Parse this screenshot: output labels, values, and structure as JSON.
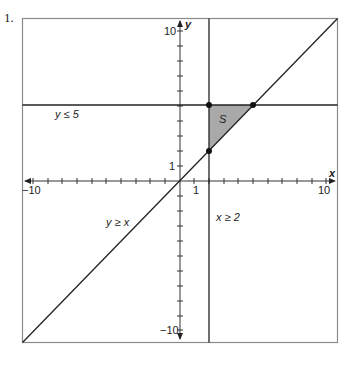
{
  "problem_number": "1.",
  "graph": {
    "x_axis_label": "x",
    "y_axis_label": "y",
    "x_range": [
      -11,
      11
    ],
    "y_range": [
      -11,
      11
    ],
    "tick_labels": {
      "x_neg": "−10",
      "x_pos": "10",
      "x_one": "1",
      "y_pos": "10",
      "y_neg": "−10",
      "y_one": "1"
    },
    "lines": [
      {
        "name": "y-le-5",
        "label": "y ≤ 5",
        "equation": "y = 5"
      },
      {
        "name": "y-ge-x",
        "label": "y ≥ x",
        "equation": "y = x"
      },
      {
        "name": "x-ge-2",
        "label": "x ≥ 2",
        "equation": "x = 2"
      }
    ],
    "region": {
      "label": "S",
      "vertices": [
        [
          2,
          5
        ],
        [
          5,
          5
        ],
        [
          2,
          2
        ]
      ],
      "fill": "#a9a9a9"
    },
    "points": [
      [
        2,
        5
      ],
      [
        5,
        5
      ],
      [
        2,
        2
      ]
    ],
    "colors": {
      "line": "#222222",
      "border": "#888888",
      "shade": "#a9a9a9"
    }
  }
}
